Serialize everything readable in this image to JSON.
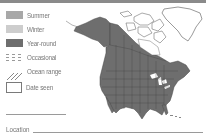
{
  "colors": {
    "topbar": "#8a8a8a",
    "summer": "#a8a8a8",
    "winter": "#cdcdcd",
    "year_round": "#6e6e6e",
    "occasional": "#9a9a9a",
    "range_fill": "#6e6e6e",
    "outline": "#555555"
  },
  "legend": {
    "items": [
      {
        "icon": "summer-swatch",
        "label": "Summer"
      },
      {
        "icon": "winter-swatch",
        "label": "Winter"
      },
      {
        "icon": "year-round-swatch",
        "label": "Year-round"
      },
      {
        "icon": "occasional-dashed-swatch",
        "label": "Occasional"
      },
      {
        "icon": "ocean-range-hatch",
        "label": "Ocean range"
      },
      {
        "icon": "date-seen-box",
        "label": "Date seen"
      }
    ],
    "location_label": "Location"
  },
  "map": {
    "region": "North America",
    "shaded_range": "Year-round"
  }
}
